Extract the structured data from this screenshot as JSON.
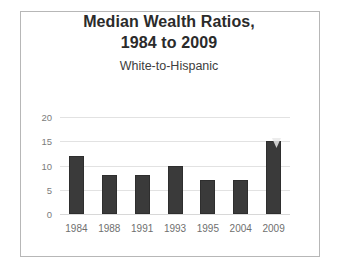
{
  "chart_data": {
    "type": "bar",
    "title": "Median Wealth Ratios, 1984 to 2009",
    "title_lines": [
      "Median Wealth Ratios,",
      "1984 to 2009"
    ],
    "subtitle": "White-to-Hispanic",
    "categories": [
      "1984",
      "1988",
      "1991",
      "1993",
      "1995",
      "2004",
      "2009"
    ],
    "values": [
      12,
      8,
      8,
      10,
      7,
      7,
      15
    ],
    "xlabel": "",
    "ylabel": "",
    "ylim": [
      0,
      20
    ],
    "yticks": [
      0,
      5,
      10,
      15,
      20
    ],
    "ytick_labels": [
      "0",
      "5",
      "10",
      "15",
      "20"
    ],
    "grid": true,
    "legend": false,
    "bar_color": "#3a3a3a",
    "gridline_color": "#e2e2e2",
    "axis_text_color": "#7c7c7c",
    "title_color": "#2b2b2b",
    "border_color": "#b7b7b7",
    "background_color": "#ffffff"
  }
}
